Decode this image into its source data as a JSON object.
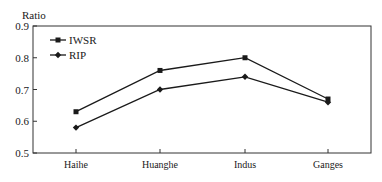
{
  "chart_data": {
    "type": "line",
    "title": "",
    "xlabel": "",
    "ylabel": "Ratio",
    "categories": [
      "Haihe",
      "Huanghe",
      "Indus",
      "Ganges"
    ],
    "series": [
      {
        "name": "IWSR",
        "marker": "square",
        "values": [
          0.63,
          0.76,
          0.8,
          0.67
        ]
      },
      {
        "name": "RIP",
        "marker": "diamond",
        "values": [
          0.58,
          0.7,
          0.74,
          0.66
        ]
      }
    ],
    "ylim": [
      0.5,
      0.9
    ],
    "yticks": [
      "0.5",
      "0.6",
      "0.7",
      "0.8",
      "0.9"
    ],
    "grid": false,
    "legend_position": "upper left",
    "colors": {
      "line": "#1a1a1a",
      "frame": "#333333",
      "background": "#ffffff"
    }
  },
  "legend": {
    "items": [
      {
        "label": "IWSR"
      },
      {
        "label": "RIP"
      }
    ]
  },
  "axis": {
    "ylabel": "Ratio"
  }
}
